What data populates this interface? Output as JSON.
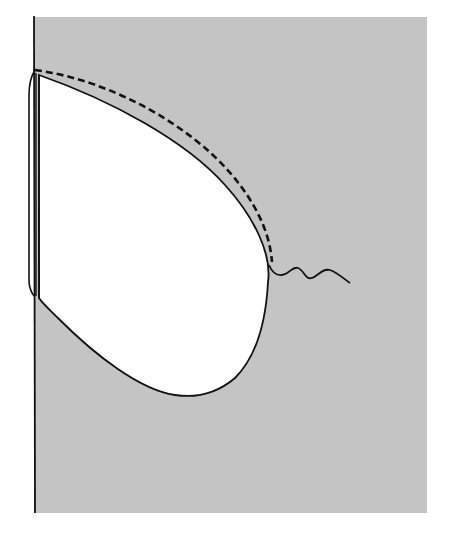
{
  "figure": {
    "width": 449,
    "height": 536,
    "colors": {
      "page_background": "#ffffff",
      "field_background": "#c4c4c4",
      "shape_fill": "#ffffff",
      "stroke": "#111111"
    },
    "elements": [
      {
        "name": "gray-field",
        "type": "rect",
        "x": 35,
        "y": 17,
        "width": 392,
        "height": 496
      },
      {
        "name": "vertical-boundary-line",
        "type": "line"
      },
      {
        "name": "teardrop-shape",
        "type": "closed-curve"
      },
      {
        "name": "double-wall-left",
        "type": "double-line"
      },
      {
        "name": "dashed-outline",
        "type": "dashed-curve"
      },
      {
        "name": "wavy-line",
        "type": "wavy-curve"
      }
    ]
  }
}
